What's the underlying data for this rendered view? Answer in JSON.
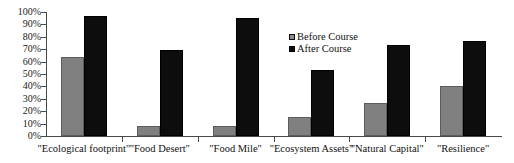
{
  "chart_data": {
    "type": "bar",
    "title": "",
    "xlabel": "",
    "ylabel": "",
    "ylim": [
      0,
      100
    ],
    "ytick_labels": [
      "100%",
      "90%",
      "80%",
      "70%",
      "60%",
      "50%",
      "40%",
      "30%",
      "20%",
      "10%",
      "0%"
    ],
    "ytick_values": [
      100,
      90,
      80,
      70,
      60,
      50,
      40,
      30,
      20,
      10,
      0
    ],
    "grid": false,
    "legend_position": "upper-center-right",
    "categories": [
      "\"Ecological footprint\"",
      "\"Food Desert\"",
      "\"Food Mile\"",
      "\"Ecosystem Assets\"",
      "\"Natural Capital\"",
      "\"Resilience\""
    ],
    "series": [
      {
        "name": "Before Course",
        "color": "#808080",
        "values": [
          64,
          8,
          8,
          15,
          27,
          40
        ]
      },
      {
        "name": "After Course",
        "color": "#0d0d0d",
        "values": [
          97,
          69,
          95,
          53,
          73,
          77
        ]
      }
    ]
  }
}
